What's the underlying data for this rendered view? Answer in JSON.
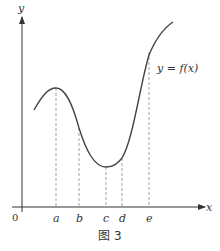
{
  "figure": {
    "caption": "图 3",
    "y_axis_label": "y",
    "x_axis_label": "x",
    "origin_label": "0",
    "curve_label": "y = f(x)",
    "ticks": [
      {
        "label": "a",
        "x": 56,
        "y_top": 88
      },
      {
        "label": "b",
        "x": 79,
        "y_top": 128
      },
      {
        "label": "c",
        "x": 106,
        "y_top": 167
      },
      {
        "label": "d",
        "x": 122,
        "y_top": 158
      },
      {
        "label": "e",
        "x": 149,
        "y_top": 52
      }
    ],
    "colors": {
      "curve": "#444444",
      "axis": "#333333",
      "dash": "#888888"
    }
  },
  "chart_data": {
    "type": "line",
    "title": "图 3",
    "xlabel": "x",
    "ylabel": "y",
    "series": [
      {
        "name": "y = f(x)",
        "description": "local max at a, decreasing through b, local min at c, increasing through d and e"
      }
    ],
    "x_ticks": [
      "a",
      "b",
      "c",
      "d",
      "e"
    ],
    "grid": false
  }
}
